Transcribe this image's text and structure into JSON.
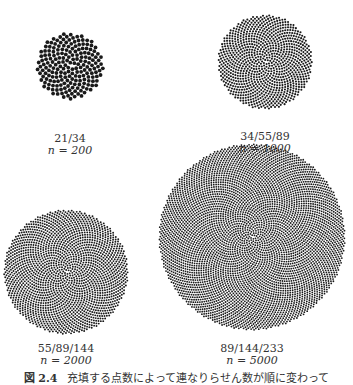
{
  "figure": {
    "panels": [
      {
        "id": "p200",
        "ratio": "21/34",
        "n_label": "n = 200",
        "n": 200,
        "cx": 70,
        "cy": 66,
        "r": 33,
        "dot": 1.9,
        "label_x": 70,
        "label_y": 133
      },
      {
        "id": "p1000",
        "ratio": "34/55/89",
        "n_label": "n = 1000",
        "n": 1000,
        "cx": 265,
        "cy": 62,
        "r": 47,
        "dot": 1.05,
        "label_x": 265,
        "label_y": 131
      },
      {
        "id": "p2000",
        "ratio": "55/89/144",
        "n_label": "n = 2000",
        "n": 2000,
        "cx": 66,
        "cy": 272,
        "r": 62,
        "dot": 0.95,
        "label_x": 66,
        "label_y": 343
      },
      {
        "id": "p5000",
        "ratio": "89/144/233",
        "n_label": "n = 5000",
        "n": 5000,
        "cx": 252,
        "cy": 237,
        "r": 93,
        "dot": 0.9,
        "label_x": 252,
        "label_y": 343
      }
    ],
    "caption": {
      "number": "図 2.4",
      "text": "充填する点数によって連なりらせん数が順に変わって"
    },
    "colors": {
      "dot": "#1a1a1a",
      "background": "#ffffff"
    }
  }
}
